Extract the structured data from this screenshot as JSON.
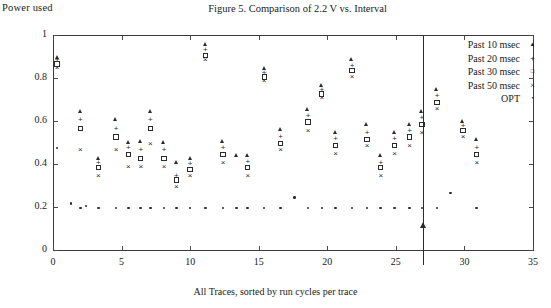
{
  "figure": {
    "title": "Figure 5. Comparison of 2.2 V vs. Interval",
    "ylabel_top": "Power used",
    "xlabel": "All Traces, sorted by run cycles per trace"
  },
  "legend": {
    "position": "top-right-inside",
    "entries": [
      {
        "label": "Past 10 msec",
        "marker": "triangle-icon",
        "glyph": "▲"
      },
      {
        "label": "Past 20 msec",
        "marker": "plus-icon",
        "glyph": "+"
      },
      {
        "label": "Past 30 msec",
        "marker": "square-icon",
        "glyph": "□"
      },
      {
        "label": "Past 50 msec",
        "marker": "cross-icon",
        "glyph": "×"
      },
      {
        "label": "OPT",
        "marker": "dot-icon",
        "glyph": "•"
      }
    ]
  },
  "annotation": {
    "arrow_x": 27,
    "arrow_label": ""
  },
  "chart_data": {
    "type": "scatter",
    "title": "Figure 5. Comparison of 2.2 V vs. Interval",
    "xlabel": "All Traces, sorted by run cycles per trace",
    "ylabel": "Power used",
    "xlim": [
      0,
      35
    ],
    "ylim": [
      0,
      1
    ],
    "xticks": [
      0,
      5,
      10,
      15,
      20,
      25,
      30,
      35
    ],
    "yticks": [
      0,
      0.2,
      0.4,
      0.6,
      0.8,
      1
    ],
    "xtick_labels": [
      "0",
      "5",
      "10",
      "15",
      "20",
      "25",
      "30",
      "35"
    ],
    "ytick_labels": [
      "0",
      "0.2",
      "0.4",
      "0.6",
      "0.8",
      "1"
    ],
    "grid": false,
    "marker_color": "#2b2b2b",
    "series": [
      {
        "name": "Past 10 msec",
        "marker": "triangle",
        "points": [
          [
            0.3,
            0.895
          ],
          [
            2.0,
            0.645
          ],
          [
            3.3,
            0.425
          ],
          [
            4.6,
            0.605
          ],
          [
            5.5,
            0.5
          ],
          [
            6.4,
            0.505
          ],
          [
            7.1,
            0.645
          ],
          [
            8.1,
            0.5
          ],
          [
            9.0,
            0.405
          ],
          [
            10.0,
            0.425
          ],
          [
            11.1,
            0.955
          ],
          [
            12.4,
            0.505
          ],
          [
            13.4,
            0.44
          ],
          [
            14.2,
            0.44
          ],
          [
            15.4,
            0.845
          ],
          [
            16.6,
            0.56
          ],
          [
            18.6,
            0.655
          ],
          [
            19.6,
            0.765
          ],
          [
            20.6,
            0.545
          ],
          [
            21.8,
            0.885
          ],
          [
            22.9,
            0.585
          ],
          [
            23.9,
            0.44
          ],
          [
            24.9,
            0.545
          ],
          [
            26.0,
            0.585
          ],
          [
            26.9,
            0.645
          ],
          [
            28.0,
            0.745
          ],
          [
            29.9,
            0.6
          ],
          [
            30.9,
            0.515
          ]
        ]
      },
      {
        "name": "Past 20 msec",
        "marker": "plus",
        "points": [
          [
            0.3,
            0.885
          ],
          [
            2.0,
            0.605
          ],
          [
            3.3,
            0.405
          ],
          [
            4.6,
            0.565
          ],
          [
            5.5,
            0.475
          ],
          [
            6.4,
            0.465
          ],
          [
            7.1,
            0.605
          ],
          [
            8.1,
            0.465
          ],
          [
            9.0,
            0.345
          ],
          [
            10.0,
            0.4
          ],
          [
            11.1,
            0.93
          ],
          [
            12.4,
            0.475
          ],
          [
            14.2,
            0.41
          ],
          [
            15.4,
            0.825
          ],
          [
            16.6,
            0.525
          ],
          [
            18.6,
            0.625
          ],
          [
            19.6,
            0.745
          ],
          [
            20.6,
            0.515
          ],
          [
            21.8,
            0.855
          ],
          [
            22.9,
            0.545
          ],
          [
            23.9,
            0.405
          ],
          [
            24.9,
            0.515
          ],
          [
            26.0,
            0.555
          ],
          [
            26.9,
            0.615
          ],
          [
            28.0,
            0.715
          ],
          [
            29.9,
            0.575
          ],
          [
            30.9,
            0.475
          ]
        ]
      },
      {
        "name": "Past 30 msec",
        "marker": "square",
        "points": [
          [
            0.3,
            0.865
          ],
          [
            2.0,
            0.565
          ],
          [
            3.3,
            0.385
          ],
          [
            4.6,
            0.525
          ],
          [
            5.5,
            0.445
          ],
          [
            6.4,
            0.425
          ],
          [
            7.1,
            0.565
          ],
          [
            8.1,
            0.425
          ],
          [
            9.0,
            0.325
          ],
          [
            10.0,
            0.375
          ],
          [
            11.1,
            0.905
          ],
          [
            12.4,
            0.445
          ],
          [
            14.2,
            0.385
          ],
          [
            15.4,
            0.805
          ],
          [
            16.6,
            0.495
          ],
          [
            18.6,
            0.595
          ],
          [
            19.6,
            0.725
          ],
          [
            20.6,
            0.485
          ],
          [
            21.8,
            0.835
          ],
          [
            22.9,
            0.515
          ],
          [
            23.9,
            0.385
          ],
          [
            24.9,
            0.485
          ],
          [
            26.0,
            0.525
          ],
          [
            26.9,
            0.585
          ],
          [
            28.0,
            0.685
          ],
          [
            29.9,
            0.555
          ],
          [
            30.9,
            0.445
          ]
        ]
      },
      {
        "name": "Past 50 msec",
        "marker": "cross",
        "points": [
          [
            0.3,
            0.845
          ],
          [
            2.0,
            0.465
          ],
          [
            3.3,
            0.345
          ],
          [
            4.6,
            0.465
          ],
          [
            5.5,
            0.385
          ],
          [
            6.4,
            0.385
          ],
          [
            7.1,
            0.495
          ],
          [
            8.1,
            0.385
          ],
          [
            9.0,
            0.295
          ],
          [
            10.0,
            0.345
          ],
          [
            11.1,
            0.885
          ],
          [
            12.4,
            0.405
          ],
          [
            14.2,
            0.345
          ],
          [
            15.4,
            0.785
          ],
          [
            16.6,
            0.465
          ],
          [
            18.6,
            0.555
          ],
          [
            19.6,
            0.705
          ],
          [
            20.6,
            0.445
          ],
          [
            21.8,
            0.805
          ],
          [
            22.9,
            0.485
          ],
          [
            23.9,
            0.345
          ],
          [
            24.9,
            0.445
          ],
          [
            26.0,
            0.485
          ],
          [
            26.9,
            0.545
          ],
          [
            28.0,
            0.655
          ],
          [
            29.9,
            0.525
          ],
          [
            30.9,
            0.405
          ]
        ]
      },
      {
        "name": "OPT",
        "marker": "dot",
        "points": [
          [
            0.3,
            0.475
          ],
          [
            1.3,
            0.215
          ],
          [
            2.0,
            0.195
          ],
          [
            2.4,
            0.205
          ],
          [
            3.3,
            0.195
          ],
          [
            4.6,
            0.195
          ],
          [
            5.5,
            0.195
          ],
          [
            6.4,
            0.195
          ],
          [
            7.1,
            0.195
          ],
          [
            8.1,
            0.195
          ],
          [
            9.0,
            0.195
          ],
          [
            10.0,
            0.195
          ],
          [
            11.1,
            0.195
          ],
          [
            12.4,
            0.195
          ],
          [
            13.4,
            0.195
          ],
          [
            14.2,
            0.195
          ],
          [
            15.4,
            0.195
          ],
          [
            16.6,
            0.195
          ],
          [
            17.6,
            0.245
          ],
          [
            18.6,
            0.195
          ],
          [
            19.6,
            0.195
          ],
          [
            20.6,
            0.195
          ],
          [
            21.8,
            0.195
          ],
          [
            22.9,
            0.195
          ],
          [
            23.9,
            0.195
          ],
          [
            24.9,
            0.195
          ],
          [
            26.0,
            0.195
          ],
          [
            26.9,
            0.195
          ],
          [
            28.0,
            0.195
          ],
          [
            29.0,
            0.265
          ],
          [
            30.9,
            0.195
          ]
        ]
      }
    ]
  }
}
